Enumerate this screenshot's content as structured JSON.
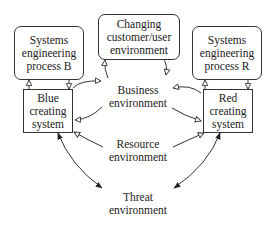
{
  "diagram": {
    "nodes": {
      "se_b": {
        "lines": [
          "Systems",
          "engineering",
          "process B"
        ]
      },
      "changing": {
        "lines": [
          "Changing",
          "customer/user",
          "environment"
        ]
      },
      "se_r": {
        "lines": [
          "Systems",
          "engineering",
          "process R"
        ]
      },
      "blue": {
        "lines": [
          "Blue",
          "creating",
          "system"
        ]
      },
      "red": {
        "lines": [
          "Red",
          "creating",
          "system"
        ]
      },
      "business": {
        "lines": [
          "Business",
          "environment"
        ]
      },
      "resource": {
        "lines": [
          "Resource",
          "environment"
        ]
      },
      "threat": {
        "lines": [
          "Threat",
          "environment"
        ]
      }
    },
    "edges": [
      {
        "from": "blue",
        "to": "se_b",
        "head": "open"
      },
      {
        "from": "se_b",
        "to": "blue",
        "head": "open"
      },
      {
        "from": "red",
        "to": "se_r",
        "head": "open"
      },
      {
        "from": "se_r",
        "to": "red",
        "head": "open"
      },
      {
        "from": "blue",
        "to": "business",
        "head": "open"
      },
      {
        "from": "business",
        "to": "blue",
        "head": "open"
      },
      {
        "from": "red",
        "to": "business",
        "head": "open"
      },
      {
        "from": "business",
        "to": "red",
        "head": "open"
      },
      {
        "from": "business",
        "to": "changing",
        "head": "open"
      },
      {
        "from": "changing",
        "to": "business",
        "head": "open"
      },
      {
        "from": "resource",
        "to": "blue",
        "head": "open"
      },
      {
        "from": "resource",
        "to": "red",
        "head": "open"
      },
      {
        "from": "blue",
        "to": "threat",
        "head": "filled",
        "bidirectional": true
      },
      {
        "from": "red",
        "to": "threat",
        "head": "filled",
        "bidirectional": true
      }
    ],
    "colors": {
      "line": "#333333",
      "background": "#ffffff",
      "text": "#222222"
    }
  }
}
